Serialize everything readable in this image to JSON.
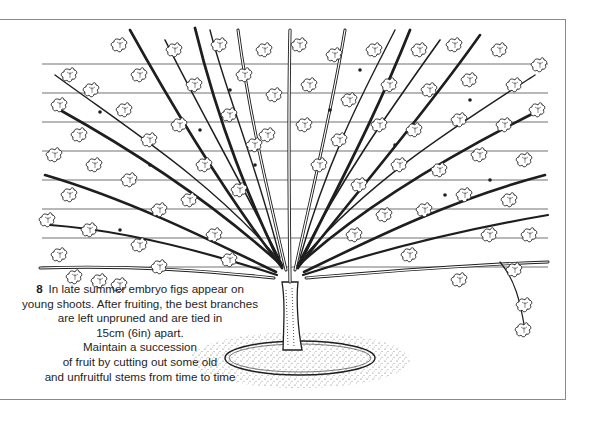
{
  "figure": {
    "number": "8",
    "caption_lines": [
      "In late summer embryo figs appear on",
      "young shoots. After fruiting, the best branches",
      "are left unpruned and are tied in",
      "15cm (6in) apart.",
      "Maintain a succession",
      "of fruit by cutting out some old",
      "and unfruitful stems from time to time"
    ]
  },
  "colors": {
    "ink": "#1e1e1e",
    "frame": "#8a8a8a",
    "background": "#ffffff"
  }
}
